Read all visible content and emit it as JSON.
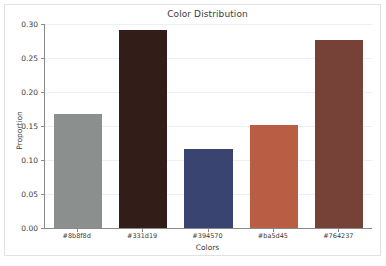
{
  "chart_data": {
    "type": "bar",
    "title": "Color Distribution",
    "xlabel": "Colors",
    "ylabel": "Proportion",
    "categories": [
      "#8b8f8d",
      "#331d19",
      "#394570",
      "#ba5d45",
      "#764237"
    ],
    "values": [
      0.168,
      0.291,
      0.116,
      0.151,
      0.277
    ],
    "bar_colors": [
      "#8b8f8d",
      "#331d19",
      "#394570",
      "#ba5d45",
      "#764237"
    ],
    "ylim": [
      0.0,
      0.3
    ],
    "ytick_labels": [
      "0.00",
      "0.05",
      "0.10",
      "0.15",
      "0.20",
      "0.25",
      "0.30"
    ],
    "ytick_values": [
      0.0,
      0.05,
      0.1,
      0.15,
      0.2,
      0.25,
      0.3
    ],
    "grid": "horizontal",
    "legend": "none",
    "background": "#ffffff",
    "grid_color": "#eceff3",
    "axis_color": "#8a8a8a",
    "text_color": "#3b3b3b"
  }
}
